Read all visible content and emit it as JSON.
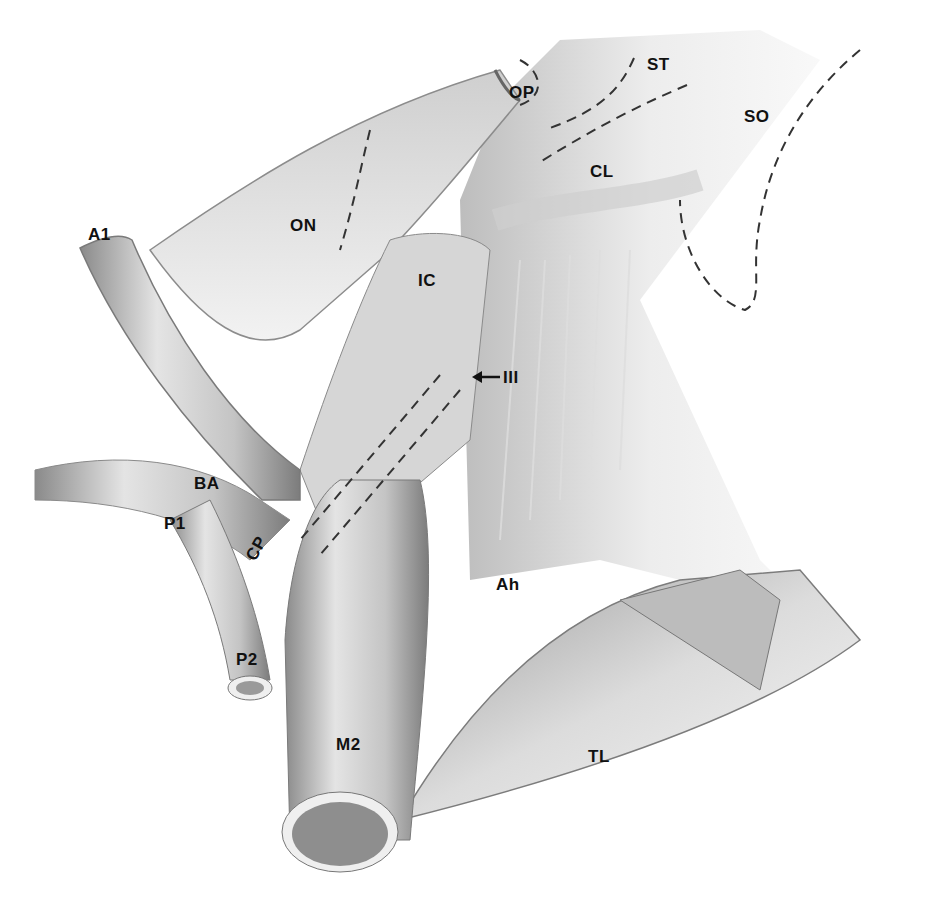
{
  "figure": {
    "type": "anatomical-illustration",
    "colors": {
      "ink": "#111111",
      "shade_dark": "#6e6e6e",
      "shade_mid": "#a8a8a8",
      "shade_light": "#d6d6d6",
      "background": "#ffffff"
    }
  },
  "labels": [
    {
      "id": "op",
      "text": "OP",
      "x": 509,
      "y": 84
    },
    {
      "id": "st",
      "text": "ST",
      "x": 647,
      "y": 56
    },
    {
      "id": "so",
      "text": "SO",
      "x": 744,
      "y": 108
    },
    {
      "id": "cl",
      "text": "CL",
      "x": 590,
      "y": 163
    },
    {
      "id": "a1",
      "text": "A1",
      "x": 88,
      "y": 226
    },
    {
      "id": "on",
      "text": "ON",
      "x": 290,
      "y": 217
    },
    {
      "id": "ic",
      "text": "IC",
      "x": 418,
      "y": 272
    },
    {
      "id": "iii",
      "text": "III",
      "x": 490,
      "y": 369
    },
    {
      "id": "ba",
      "text": "BA",
      "x": 194,
      "y": 475
    },
    {
      "id": "p1",
      "text": "P1",
      "x": 164,
      "y": 515
    },
    {
      "id": "cp",
      "text": "CP",
      "x": 244,
      "y": 533
    },
    {
      "id": "ah",
      "text": "Ah",
      "x": 496,
      "y": 576
    },
    {
      "id": "p2",
      "text": "P2",
      "x": 236,
      "y": 651
    },
    {
      "id": "m2",
      "text": "M2",
      "x": 336,
      "y": 736
    },
    {
      "id": "tl",
      "text": "TL",
      "x": 588,
      "y": 748
    }
  ],
  "annotations": {
    "arrow_to": "iii",
    "dashed_outlines": [
      "ST",
      "SO",
      "CL",
      "OP",
      "ON",
      "vessel-path"
    ]
  }
}
